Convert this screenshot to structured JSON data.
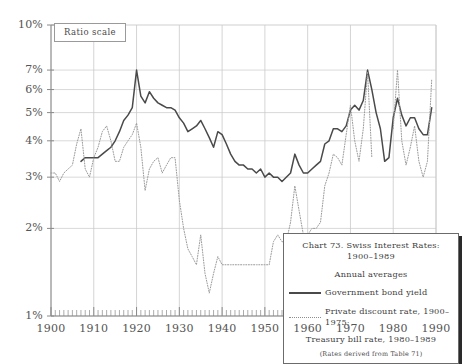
{
  "chart_data": {
    "type": "line",
    "title": "Chart 73. Swiss Interest Rates: 1900–1989",
    "subtitle": "Annual averages",
    "note": "(Rates derived from Table 71)",
    "scale_label": "Ratio scale",
    "xlabel": "",
    "ylabel": "",
    "yscale": "log",
    "ylim": [
      1,
      10
    ],
    "xlim": [
      1900,
      1990
    ],
    "grid": true,
    "legend_position": "inside-bottom-right",
    "ytick_labels": [
      "10%",
      "7%",
      "6%",
      "5%",
      "4%",
      "3%",
      "2%",
      "1%"
    ],
    "ytick_values": [
      10,
      7,
      6,
      5,
      4,
      3,
      2,
      1
    ],
    "xtick_labels": [
      "1900",
      "1910",
      "1920",
      "1930",
      "1940",
      "1950",
      "1960",
      "1970",
      "1980",
      "1990"
    ],
    "xtick_values": [
      1900,
      1910,
      1920,
      1930,
      1940,
      1950,
      1960,
      1970,
      1980,
      1990
    ],
    "colors": {
      "bond": "#4a4a4a",
      "discount": "#9a9a9a",
      "grid": "#c9c9c9",
      "axis": "#8a8a8a"
    },
    "series": [
      {
        "name": "Government bond yield",
        "style": "solid",
        "x": [
          1907,
          1908,
          1909,
          1910,
          1911,
          1912,
          1913,
          1914,
          1915,
          1916,
          1917,
          1918,
          1919,
          1920,
          1921,
          1922,
          1923,
          1924,
          1925,
          1926,
          1927,
          1928,
          1929,
          1930,
          1931,
          1932,
          1933,
          1934,
          1935,
          1936,
          1937,
          1938,
          1939,
          1940,
          1941,
          1942,
          1943,
          1944,
          1945,
          1946,
          1947,
          1948,
          1949,
          1950,
          1951,
          1952,
          1953,
          1954,
          1955,
          1956,
          1957,
          1958,
          1959,
          1960,
          1961,
          1962,
          1963,
          1964,
          1965,
          1966,
          1967,
          1968,
          1969,
          1970,
          1971,
          1972,
          1973,
          1974,
          1975,
          1976,
          1977,
          1978,
          1979,
          1980,
          1981,
          1982,
          1983,
          1984,
          1985,
          1986,
          1987,
          1988,
          1989
        ],
        "y": [
          3.4,
          3.5,
          3.5,
          3.5,
          3.5,
          3.6,
          3.7,
          3.8,
          4.0,
          4.3,
          4.7,
          4.9,
          5.2,
          7.0,
          5.7,
          5.4,
          5.9,
          5.6,
          5.4,
          5.3,
          5.2,
          5.2,
          5.1,
          4.8,
          4.6,
          4.3,
          4.4,
          4.5,
          4.7,
          4.4,
          4.1,
          3.8,
          4.3,
          4.2,
          3.9,
          3.6,
          3.4,
          3.3,
          3.3,
          3.2,
          3.2,
          3.1,
          3.2,
          3.0,
          3.1,
          3.0,
          3.0,
          2.9,
          3.0,
          3.1,
          3.6,
          3.3,
          3.1,
          3.1,
          3.2,
          3.3,
          3.4,
          3.9,
          4.0,
          4.4,
          4.4,
          4.3,
          4.5,
          5.1,
          5.3,
          5.1,
          5.5,
          7.0,
          6.0,
          5.0,
          4.4,
          3.4,
          3.5,
          4.8,
          5.6,
          4.9,
          4.5,
          4.8,
          4.8,
          4.4,
          4.2,
          4.2,
          5.2
        ]
      },
      {
        "name": "Private discount rate, 1900–1975; Treasury bill rate, 1980–1989",
        "style": "dotted",
        "x": [
          1900,
          1901,
          1902,
          1903,
          1904,
          1905,
          1906,
          1907,
          1908,
          1909,
          1910,
          1911,
          1912,
          1913,
          1914,
          1915,
          1916,
          1917,
          1918,
          1919,
          1920,
          1921,
          1922,
          1923,
          1924,
          1925,
          1926,
          1927,
          1928,
          1929,
          1930,
          1931,
          1932,
          1933,
          1934,
          1935,
          1936,
          1937,
          1938,
          1939,
          1940,
          1941,
          1942,
          1943,
          1944,
          1945,
          1946,
          1947,
          1948,
          1949,
          1950,
          1951,
          1952,
          1953,
          1954,
          1955,
          1956,
          1957,
          1958,
          1959,
          1960,
          1961,
          1962,
          1963,
          1964,
          1965,
          1966,
          1967,
          1968,
          1969,
          1970,
          1971,
          1972,
          1973,
          1974,
          1975,
          1980,
          1981,
          1982,
          1983,
          1984,
          1985,
          1986,
          1987,
          1988,
          1989
        ],
        "y": [
          3.1,
          3.1,
          2.9,
          3.1,
          3.2,
          3.3,
          3.9,
          4.4,
          3.2,
          3.0,
          3.5,
          3.8,
          4.3,
          4.5,
          4.0,
          3.4,
          3.4,
          3.8,
          4.0,
          4.2,
          4.6,
          3.8,
          2.7,
          3.2,
          3.4,
          3.5,
          3.1,
          3.3,
          3.5,
          3.5,
          2.5,
          2.0,
          1.7,
          1.6,
          1.5,
          1.9,
          1.4,
          1.2,
          1.4,
          1.6,
          1.5,
          1.5,
          1.5,
          1.5,
          1.5,
          1.5,
          1.5,
          1.5,
          1.5,
          1.5,
          1.5,
          1.5,
          1.8,
          1.9,
          1.8,
          1.8,
          2.1,
          2.8,
          2.3,
          1.9,
          1.9,
          2.0,
          2.0,
          2.1,
          2.8,
          3.1,
          3.6,
          3.5,
          3.3,
          4.2,
          5.3,
          4.0,
          3.4,
          4.4,
          6.9,
          3.5,
          4.4,
          7.0,
          4.0,
          3.3,
          3.8,
          4.5,
          3.4,
          3.0,
          3.4,
          6.5
        ]
      }
    ]
  },
  "axes": {
    "ratio_scale_label": "Ratio scale"
  },
  "legend": {
    "title_line1": "Chart 73. Swiss Interest Rates:",
    "title_line2": "1900–1989",
    "subtitle": "Annual averages",
    "series1_label": "Government bond yield",
    "series2_label_line1": "Private discount rate, 1900–1975;",
    "series2_label_line2": "Treasury bill rate, 1980–1989",
    "note": "(Rates derived from Table 71)"
  }
}
